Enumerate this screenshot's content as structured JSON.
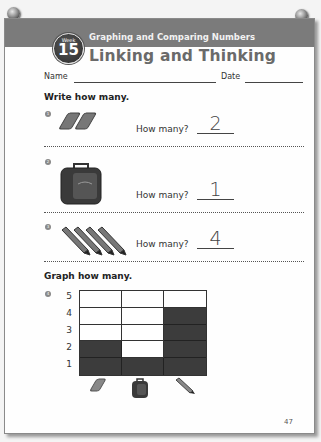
{
  "header": {
    "badge_label": "Week",
    "badge_number": "15",
    "subtitle": "Graphing and Comparing Numbers",
    "title": "Linking and Thinking",
    "band_color": "#7b7b7b"
  },
  "fields": {
    "name_label": "Name",
    "date_label": "Date"
  },
  "section1": {
    "heading": "Write how many.",
    "questions": [
      {
        "number": "1",
        "object": "eraser",
        "object_count": 2,
        "prompt": "How many?",
        "answer": "2"
      },
      {
        "number": "2",
        "object": "lunchbox",
        "object_count": 1,
        "prompt": "How many?",
        "answer": "1"
      },
      {
        "number": "3",
        "object": "pencil",
        "object_count": 4,
        "prompt": "How many?",
        "answer": "4"
      }
    ]
  },
  "section2": {
    "heading": "Graph how many.",
    "question_number": "4",
    "y_labels": [
      "5",
      "4",
      "3",
      "2",
      "1"
    ],
    "columns": [
      {
        "object": "eraser",
        "value": 2
      },
      {
        "object": "lunchbox",
        "value": 1
      },
      {
        "object": "pencil",
        "value": 4
      }
    ],
    "max": 5
  },
  "footer": {
    "page_number": "47"
  },
  "chart_data": {
    "type": "bar",
    "title": "Graph how many.",
    "categories": [
      "eraser",
      "lunchbox",
      "pencil"
    ],
    "values": [
      2,
      1,
      4
    ],
    "xlabel": "",
    "ylabel": "",
    "ylim": [
      0,
      5
    ],
    "y_ticks": [
      1,
      2,
      3,
      4,
      5
    ],
    "grid": true
  }
}
